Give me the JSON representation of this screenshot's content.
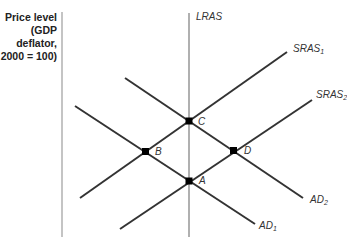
{
  "diagram": {
    "y_axis_label": [
      "Price level",
      "(GDP",
      "deflator,",
      "2000 = 100)"
    ],
    "curves": {
      "lras": {
        "label": "LRAS",
        "color": "#b0b0b0"
      },
      "sras1": {
        "label": "SRAS",
        "sub": "1",
        "color": "#333333"
      },
      "sras2": {
        "label": "SRAS",
        "sub": "2",
        "color": "#333333"
      },
      "ad1": {
        "label": "AD",
        "sub": "1",
        "color": "#333333"
      },
      "ad2": {
        "label": "AD",
        "sub": "2",
        "color": "#333333"
      }
    },
    "points": {
      "a": {
        "label": "A"
      },
      "b": {
        "label": "B"
      },
      "c": {
        "label": "C"
      },
      "d": {
        "label": "D"
      }
    },
    "axis_color": "#b0b0b0"
  }
}
